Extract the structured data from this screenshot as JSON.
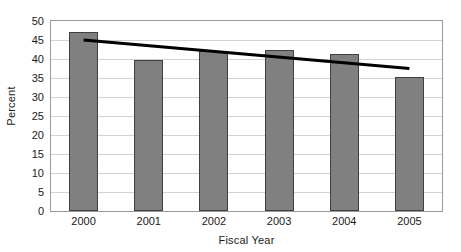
{
  "chart_data": {
    "type": "bar",
    "title": "",
    "subtitle": "",
    "xlabel": "Fiscal Year",
    "ylabel": "Percent",
    "categories": [
      "2000",
      "2001",
      "2002",
      "2003",
      "2004",
      "2005"
    ],
    "values": [
      47,
      39.7,
      42,
      42.4,
      41.3,
      35.3
    ],
    "series": [
      {
        "name": "Percent",
        "type": "bar",
        "values": [
          47,
          39.7,
          42,
          42.4,
          41.3,
          35.3
        ]
      },
      {
        "name": "Linear trend",
        "type": "line",
        "values": [
          45,
          43.5,
          42,
          40.5,
          39,
          37.5
        ],
        "endpoints": [
          {
            "x": "2000",
            "y": 45
          },
          {
            "x": "2005",
            "y": 37.5
          }
        ]
      }
    ],
    "ylim": [
      0,
      50
    ],
    "ytick_labels": [
      "0",
      "5",
      "10",
      "15",
      "20",
      "25",
      "30",
      "35",
      "40",
      "45",
      "50"
    ],
    "ytick_values": [
      0,
      5,
      10,
      15,
      20,
      25,
      30,
      35,
      40,
      45,
      50
    ],
    "ytick_step": 5,
    "xtick_labels": [
      "2000",
      "2001",
      "2002",
      "2003",
      "2004",
      "2005"
    ],
    "grid": "horizontal",
    "legend": "none",
    "legend_position": "none",
    "colors": {
      "bar_fill": "#808080",
      "bar_border": "#404040",
      "trendline": "#000000",
      "gridline": "#d2d2d2",
      "axis": "#9a9a9a",
      "plot_background": "#ffffff",
      "text": "#1a1a1a"
    },
    "annotations": []
  }
}
